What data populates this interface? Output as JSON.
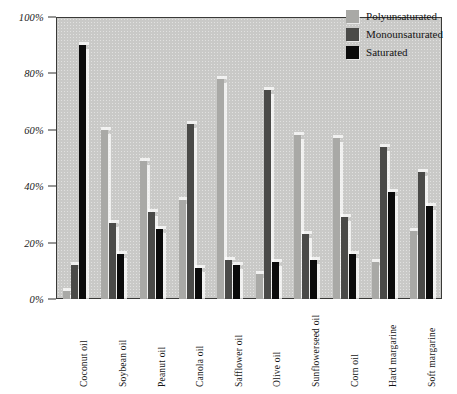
{
  "chart_data": {
    "type": "bar",
    "title": "",
    "subtitle": "",
    "xlabel": "",
    "ylabel": "",
    "ylim": [
      0,
      100
    ],
    "ytick_labels": [
      "0%",
      "20%",
      "40%",
      "60%",
      "80%",
      "100%"
    ],
    "ytick_values": [
      0,
      20,
      40,
      60,
      80,
      100
    ],
    "grid": false,
    "legend_position": "top-right",
    "categories": [
      "Coconut oil",
      "Soybean oil",
      "Peanut oil",
      "Canola oil",
      "Safflower oil",
      "Olive oil",
      "Sunflowerseed oil",
      "Corn oil",
      "Hard margarine",
      "Soft margarine"
    ],
    "series": [
      {
        "name": "Polyunsaturated",
        "color": "#a9a9a6",
        "values": [
          3,
          60,
          49,
          35,
          78,
          9,
          58,
          57,
          13,
          24
        ]
      },
      {
        "name": "Monounsaturated",
        "color": "#4a4a48",
        "values": [
          12,
          27,
          31,
          62,
          14,
          74,
          23,
          29,
          54,
          45
        ]
      },
      {
        "name": "Saturated",
        "color": "#0b0b0b",
        "values": [
          90,
          16,
          25,
          11,
          12,
          13,
          14,
          16,
          38,
          33
        ]
      }
    ]
  },
  "legend": {
    "items": [
      {
        "label": "Polyunsaturated",
        "swatch": "#a9a9a6"
      },
      {
        "label": "Monounsaturated",
        "swatch": "#4a4a48"
      },
      {
        "label": "Saturated",
        "swatch": "#0b0b0b"
      }
    ]
  },
  "colors": {
    "plot_background": "#c9c9c7",
    "frame": "#3a3a38",
    "page_background": "#ffffff",
    "text": "#141414"
  }
}
